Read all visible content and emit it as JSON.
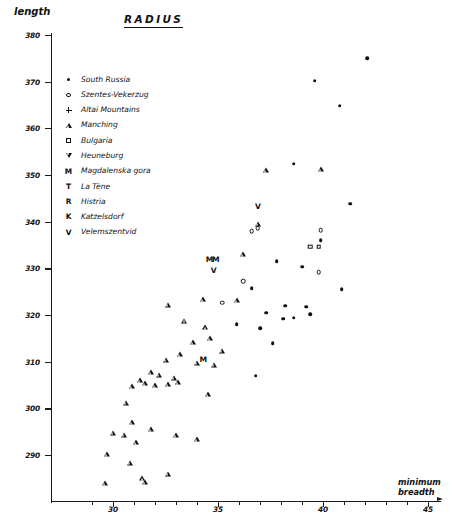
{
  "chart_data": {
    "type": "scatter",
    "title": "RADIUS",
    "xlabel": "minimum breadth",
    "ylabel": "length",
    "xlim": [
      28.5,
      45.5
    ],
    "ylim": [
      283,
      381
    ],
    "grid": false,
    "legend_position": "upper-left-inside",
    "xticks": [
      30,
      35,
      40,
      45
    ],
    "xticks_minor_step": 1,
    "yticks": [
      290,
      300,
      310,
      320,
      330,
      340,
      350,
      360,
      370,
      380
    ],
    "series": [
      {
        "name": "South Russia",
        "marker": "filled-circle",
        "marker_glyph": "dot",
        "points": [
          [
            42.1,
            375.0
          ],
          [
            39.6,
            370.2
          ],
          [
            40.8,
            364.8
          ],
          [
            38.6,
            352.4
          ],
          [
            41.3,
            343.8
          ],
          [
            39.9,
            336.0
          ],
          [
            37.8,
            331.5
          ],
          [
            39.0,
            330.3
          ],
          [
            40.9,
            325.5
          ],
          [
            36.6,
            325.8
          ],
          [
            38.2,
            322.0
          ],
          [
            39.2,
            321.8
          ],
          [
            38.6,
            319.4
          ],
          [
            37.3,
            320.5
          ],
          [
            37.0,
            317.2
          ],
          [
            37.6,
            314.0
          ],
          [
            38.1,
            319.2
          ],
          [
            35.9,
            318.0
          ],
          [
            39.4,
            320.2
          ],
          [
            36.8,
            307.0
          ]
        ]
      },
      {
        "name": "Szentes-Vekerzug",
        "marker": "open-circle",
        "marker_glyph": "circle",
        "points": [
          [
            36.9,
            338.6
          ],
          [
            39.9,
            338.2
          ],
          [
            36.6,
            338.0
          ],
          [
            39.8,
            329.2
          ],
          [
            36.2,
            327.2
          ],
          [
            35.2,
            322.6
          ]
        ]
      },
      {
        "name": "Altai Mountains",
        "marker": "plus",
        "marker_glyph": "plus",
        "points": []
      },
      {
        "name": "Manching",
        "marker": "open-triangle-up",
        "marker_glyph": "triangle",
        "points": [
          [
            37.3,
            351.0
          ],
          [
            39.9,
            351.2
          ],
          [
            36.9,
            339.6
          ],
          [
            36.2,
            333.0
          ],
          [
            35.9,
            323.2
          ],
          [
            34.3,
            323.4
          ],
          [
            32.6,
            322.2
          ],
          [
            33.4,
            318.8
          ],
          [
            34.4,
            317.4
          ],
          [
            34.6,
            315.0
          ],
          [
            33.8,
            314.2
          ],
          [
            35.2,
            312.4
          ],
          [
            33.2,
            311.6
          ],
          [
            32.5,
            310.4
          ],
          [
            34.0,
            309.8
          ],
          [
            34.8,
            309.4
          ],
          [
            31.8,
            307.8
          ],
          [
            32.2,
            307.2
          ],
          [
            32.9,
            306.6
          ],
          [
            31.3,
            306.0
          ],
          [
            31.5,
            305.4
          ],
          [
            32.0,
            305.0
          ],
          [
            32.6,
            305.2
          ],
          [
            33.1,
            305.6
          ],
          [
            30.9,
            304.8
          ],
          [
            34.5,
            303.0
          ],
          [
            30.6,
            301.2
          ],
          [
            30.9,
            297.0
          ],
          [
            31.8,
            295.6
          ],
          [
            30.0,
            294.8
          ],
          [
            30.5,
            294.4
          ],
          [
            33.0,
            294.2
          ],
          [
            34.0,
            293.4
          ],
          [
            31.1,
            292.8
          ],
          [
            29.7,
            290.2
          ],
          [
            30.8,
            288.4
          ],
          [
            31.4,
            285.0
          ],
          [
            32.6,
            286.0
          ],
          [
            29.6,
            284.0
          ],
          [
            31.5,
            284.2
          ]
        ]
      },
      {
        "name": "Bulgaria",
        "marker": "open-square",
        "marker_glyph": "square",
        "label_letter": "B",
        "points": [
          [
            39.4,
            334.6
          ],
          [
            39.8,
            334.6
          ]
        ]
      },
      {
        "name": "Heuneburg",
        "marker": "open-triangle-down",
        "marker_glyph": "down-triangle",
        "points": []
      },
      {
        "name": "Magdalenska gora",
        "marker": "letter-M",
        "marker_glyph": "letter",
        "label_letter": "M",
        "points": [
          [
            34.6,
            331.8
          ],
          [
            34.9,
            331.8
          ],
          [
            34.3,
            310.4
          ]
        ]
      },
      {
        "name": "La Tène",
        "marker": "letter-T",
        "marker_glyph": "letter",
        "label_letter": "T",
        "points": []
      },
      {
        "name": "Histria",
        "marker": "letter-R",
        "marker_glyph": "letter",
        "label_letter": "R",
        "points": []
      },
      {
        "name": "Katzelsdorf",
        "marker": "letter-K",
        "marker_glyph": "letter",
        "label_letter": "K",
        "points": []
      },
      {
        "name": "Velemszentvid",
        "marker": "letter-V",
        "marker_glyph": "letter",
        "label_letter": "V",
        "points": [
          [
            36.9,
            343.2
          ],
          [
            34.8,
            329.4
          ]
        ]
      }
    ]
  },
  "legend": {
    "items": [
      {
        "label": "South Russia",
        "glyph": "dot"
      },
      {
        "label": "Szentes-Vekerzug",
        "glyph": "circle"
      },
      {
        "label": "Altai Mountains",
        "glyph": "plus"
      },
      {
        "label": "Manching",
        "glyph": "triangle"
      },
      {
        "label": "Bulgaria",
        "glyph": "square"
      },
      {
        "label": "Heuneburg",
        "glyph": "down-triangle"
      },
      {
        "label": "Magdalenska gora",
        "glyph": "letter",
        "letter": "M"
      },
      {
        "label": "La Tène",
        "glyph": "letter",
        "letter": "T"
      },
      {
        "label": "Histria",
        "glyph": "letter",
        "letter": "R"
      },
      {
        "label": "Katzelsdorf",
        "glyph": "letter",
        "letter": "K"
      },
      {
        "label": "Velemszentvid",
        "glyph": "letter",
        "letter": "V"
      }
    ]
  },
  "colors": {
    "ink": "#111111",
    "background": "#ffffff"
  }
}
